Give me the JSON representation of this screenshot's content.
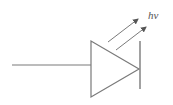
{
  "diagram": {
    "type": "led-schematic-symbol",
    "label": "hν",
    "stroke_color": "#7a7a7a",
    "arrow_color": "#555555",
    "background": "#ffffff"
  }
}
